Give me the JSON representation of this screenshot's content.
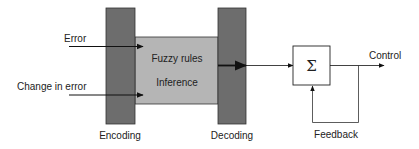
{
  "diagram": {
    "inputs": [
      {
        "label": "Error"
      },
      {
        "label": "Change in error"
      }
    ],
    "blocks": {
      "encoding": {
        "label": "Encoding"
      },
      "core": {
        "line1": "Fuzzy rules",
        "line2": "Inference"
      },
      "decoding": {
        "label": "Decoding"
      },
      "summer": {
        "symbol": "Σ"
      }
    },
    "output": {
      "label": "Control"
    },
    "feedback": {
      "label": "Feedback"
    },
    "colors": {
      "encoding_block": "#6d6d6d",
      "core_block": "#b5b5b5",
      "decoding_block": "#6d6d6d",
      "line": "#222222"
    }
  }
}
